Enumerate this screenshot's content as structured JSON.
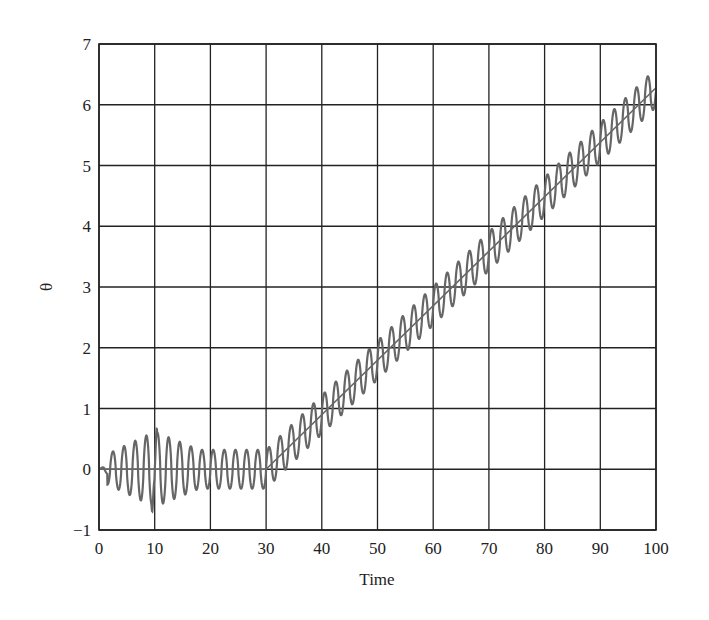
{
  "chart_data": {
    "type": "line",
    "title": "",
    "xlabel": "Time",
    "ylabel": "θ",
    "xlim": [
      0,
      100
    ],
    "ylim": [
      -1,
      7
    ],
    "xticks": [
      0,
      10,
      20,
      30,
      40,
      50,
      60,
      70,
      80,
      90,
      100
    ],
    "yticks": [
      -1,
      0,
      1,
      2,
      3,
      4,
      5,
      6,
      7
    ],
    "xtick_labels": [
      "0",
      "10",
      "20",
      "30",
      "40",
      "50",
      "60",
      "70",
      "80",
      "90",
      "100"
    ],
    "ytick_labels": [
      "−1",
      "0",
      "1",
      "2",
      "3",
      "4",
      "5",
      "6",
      "7"
    ],
    "grid": true,
    "legend": null,
    "series": [
      {
        "name": "reference",
        "description": "Piecewise reference: 0 for t in [0,30], then linear ramp to 2π at t=100",
        "x": [
          0,
          30,
          100
        ],
        "y": [
          0,
          0,
          6.28
        ]
      },
      {
        "name": "theta",
        "description": "Oscillating response around reference, period ≈ 2, amplitude grows to ≈0.6 near t=10, settles ≈0.3",
        "period": 2.0,
        "samples_x": [
          0,
          2.5,
          3.5,
          4.5,
          5.5,
          6.5,
          7.5,
          8.5,
          9.5,
          10.5,
          11.5,
          12.5,
          14.5,
          16.5,
          20.5,
          24.5,
          28.5,
          30,
          40,
          50,
          60,
          70,
          80,
          90,
          99
        ],
        "samples_y": [
          0,
          0.3,
          -0.35,
          0.4,
          -0.45,
          0.5,
          -0.55,
          0.6,
          -0.6,
          0.6,
          -0.5,
          0.45,
          0.4,
          0.35,
          0.3,
          0.3,
          0.3,
          0.0,
          1.1,
          2.1,
          3.0,
          4.0,
          4.9,
          5.8,
          6.75
        ]
      }
    ],
    "colors": {
      "grid": "#222222",
      "curve": "#666666",
      "reference": "#666666"
    }
  }
}
